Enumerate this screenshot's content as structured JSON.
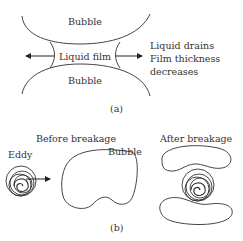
{
  "panel_a": {
    "top_bubble": "Bubble",
    "bottom_bubble": "Bubble",
    "film": "Liquid film",
    "note_lines": [
      "Liquid drains",
      "Film thickness",
      "decreases"
    ],
    "caption": "(a)"
  },
  "panel_b": {
    "before_title": "Before breakage",
    "after_title": "After breakage",
    "eddy": "Eddy",
    "bubble": "Bubble",
    "caption": "(b)"
  }
}
